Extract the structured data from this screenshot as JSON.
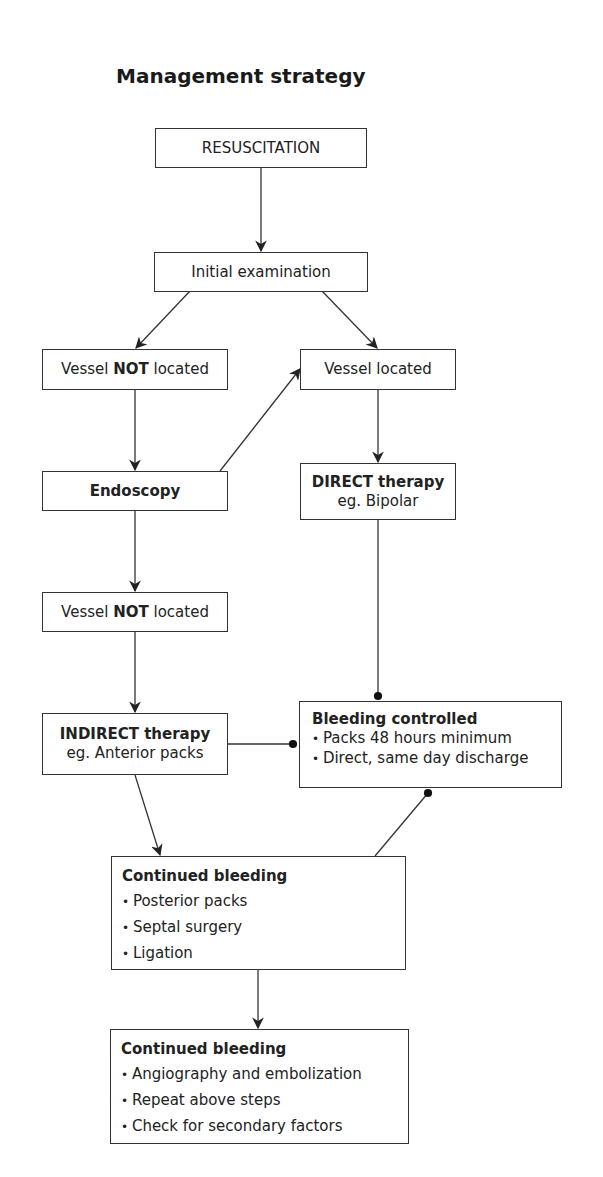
{
  "title": "Management strategy",
  "nodes": {
    "resuscitation": {
      "label": "RESUSCITATION"
    },
    "initial_exam": {
      "label": "Initial examination"
    },
    "vessel_not_located_1": {
      "pre": "Vessel ",
      "bold": "NOT",
      "post": " located"
    },
    "vessel_located": {
      "label": "Vessel located"
    },
    "endoscopy": {
      "label": "Endoscopy"
    },
    "direct_therapy": {
      "title": "DIRECT therapy",
      "subtitle": "eg. Bipolar"
    },
    "vessel_not_located_2": {
      "pre": "Vessel ",
      "bold": "NOT",
      "post": " located"
    },
    "indirect_therapy": {
      "title": "INDIRECT therapy",
      "subtitle": "eg. Anterior packs"
    },
    "bleeding_controlled": {
      "title": "Bleeding controlled",
      "items": [
        "Packs 48 hours minimum",
        "Direct, same day discharge"
      ]
    },
    "continued_bleeding_1": {
      "title": "Continued bleeding",
      "items": [
        "Posterior packs",
        "Septal surgery",
        "Ligation"
      ]
    },
    "continued_bleeding_2": {
      "title": "Continued bleeding",
      "items": [
        "Angiography and embolization",
        "Repeat above steps",
        "Check for secondary factors"
      ]
    }
  },
  "edges": [
    {
      "from": "resuscitation",
      "to": "initial_exam",
      "end": "arrow"
    },
    {
      "from": "initial_exam",
      "to": "vessel_not_located_1",
      "end": "arrow"
    },
    {
      "from": "initial_exam",
      "to": "vessel_located",
      "end": "arrow"
    },
    {
      "from": "vessel_not_located_1",
      "to": "endoscopy",
      "end": "arrow"
    },
    {
      "from": "endoscopy",
      "to": "vessel_located",
      "end": "arrow"
    },
    {
      "from": "vessel_located",
      "to": "direct_therapy",
      "end": "arrow"
    },
    {
      "from": "endoscopy",
      "to": "vessel_not_located_2",
      "end": "arrow"
    },
    {
      "from": "vessel_not_located_2",
      "to": "indirect_therapy",
      "end": "arrow"
    },
    {
      "from": "direct_therapy",
      "to": "bleeding_controlled",
      "end": "dot"
    },
    {
      "from": "indirect_therapy",
      "to": "bleeding_controlled",
      "end": "dot"
    },
    {
      "from": "indirect_therapy",
      "to": "continued_bleeding_1",
      "end": "arrow"
    },
    {
      "from": "continued_bleeding_1",
      "to": "bleeding_controlled",
      "end": "dot"
    },
    {
      "from": "continued_bleeding_1",
      "to": "continued_bleeding_2",
      "end": "arrow"
    }
  ]
}
